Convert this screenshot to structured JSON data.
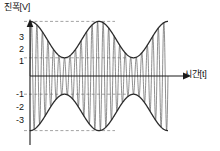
{
  "chart_data": {
    "type": "line",
    "title": "",
    "xlabel": "시간[t]",
    "ylabel": "진폭[V]",
    "ylim": [
      -3.6,
      3.6
    ],
    "xlim": [
      0,
      2
    ],
    "grid": "dashed horizontal gridlines at y = 3, 1, -1, -3",
    "legend": "none",
    "y_ticks": [
      {
        "value": 3,
        "label": "3"
      },
      {
        "value": 2,
        "label": "2"
      },
      {
        "value": 1,
        "label": "1"
      },
      {
        "value": -1,
        "label": "-1"
      },
      {
        "value": -2,
        "label": "-2"
      },
      {
        "value": -3,
        "label": "-3"
      }
    ],
    "x_ticks": [],
    "gridlines": [
      3,
      1,
      -1,
      -3
    ],
    "annotations": [],
    "series": [
      {
        "name": "envelope_upper",
        "kind": "envelope",
        "formula": "2 + cos(2*pi*x)",
        "max": 3,
        "min": 1
      },
      {
        "name": "envelope_lower",
        "kind": "envelope",
        "formula": "-(2 + cos(2*pi*x))",
        "max": -1,
        "min": -3
      },
      {
        "name": "modulated_carrier",
        "kind": "carrier",
        "formula": "(2 + cos(2*pi*x)) * sin(2*pi*25*x)",
        "carrier_cycles": 25,
        "envelope_lobes": 2,
        "peak_amplitude": 3,
        "trough_amplitude": 1
      }
    ]
  },
  "axes": {
    "y_title": "진폭[V]",
    "x_title": "시간[t]",
    "tick_labels": {
      "p3": "3",
      "p2": "2",
      "p1": "1",
      "n1": "-1",
      "n2": "-2",
      "n3": "-3"
    }
  },
  "style": {
    "axis_color": "#1a1a1a",
    "curve_color": "#2b2b2b",
    "carrier_color": "#6a6a6a",
    "grid_color": "#8c8c8c",
    "background": "#ffffff"
  }
}
